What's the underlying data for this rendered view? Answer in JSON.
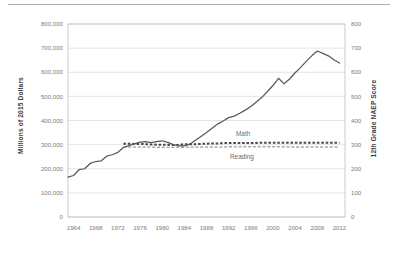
{
  "figure": {
    "name": "education-spending-vs-naep-scores-chart",
    "top_rule": true
  },
  "axes": {
    "left_title": "Millions of 2015 Dollars",
    "right_title": "12th Grade NAEP Score",
    "left_ticks": [
      "0",
      "100,000",
      "200,000",
      "300,000",
      "400,000",
      "500,000",
      "600,000",
      "700,000",
      "800,000"
    ],
    "right_ticks": [
      "0",
      "100",
      "200",
      "300",
      "400",
      "500",
      "600",
      "700",
      "800"
    ],
    "x_ticks": [
      "1964",
      "1968",
      "1972",
      "1976",
      "1980",
      "1984",
      "1988",
      "1992",
      "1996",
      "2000",
      "2004",
      "2008",
      "2012"
    ]
  },
  "labels": {
    "math": "Math",
    "reading": "Reading"
  },
  "colors": {
    "line": "#595959",
    "grid": "#d9d9d9",
    "frame": "#bfbfbf",
    "text": "#7a7a7a",
    "title": "#3f3f3f",
    "rule": "#b0b0b0"
  },
  "chart_data": {
    "type": "line",
    "title": "",
    "xlabel": "",
    "ylabel": "Millions of 2015 Dollars",
    "y2label": "12th Grade NAEP Score",
    "xlim": [
      1963,
      2013
    ],
    "ylim": [
      0,
      800000
    ],
    "y2lim": [
      0,
      800
    ],
    "grid": true,
    "legend": "inline-annotations",
    "x": [
      1963,
      1964,
      1965,
      1966,
      1967,
      1968,
      1969,
      1970,
      1971,
      1972,
      1973,
      1974,
      1975,
      1976,
      1977,
      1978,
      1979,
      1980,
      1981,
      1982,
      1983,
      1984,
      1985,
      1986,
      1987,
      1988,
      1989,
      1990,
      1991,
      1992,
      1993,
      1994,
      1995,
      1996,
      1997,
      1998,
      1999,
      2000,
      2001,
      2002,
      2003,
      2004,
      2005,
      2006,
      2007,
      2008,
      2009,
      2010,
      2011,
      2012
    ],
    "series": [
      {
        "name": "Total Spending",
        "axis": "left",
        "style": "solid",
        "units": "Millions of 2015 Dollars",
        "values": [
          165000,
          172000,
          196000,
          200000,
          222000,
          230000,
          233000,
          252000,
          258000,
          268000,
          288000,
          296000,
          303000,
          310000,
          312000,
          308000,
          312000,
          316000,
          309000,
          300000,
          295000,
          295000,
          302000,
          318000,
          334000,
          350000,
          368000,
          385000,
          398000,
          412000,
          418000,
          430000,
          443000,
          458000,
          477000,
          496000,
          520000,
          545000,
          575000,
          552000,
          572000,
          598000,
          620000,
          645000,
          668000,
          688000,
          678000,
          668000,
          652000,
          638000
        ]
      },
      {
        "name": "Math",
        "axis": "right",
        "style": "dotted-bold",
        "units": "12th Grade NAEP Score",
        "x": [
          1973,
          1974,
          1975,
          1976,
          1977,
          1978,
          1979,
          1980,
          1981,
          1982,
          1983,
          1984,
          1985,
          1986,
          1987,
          1988,
          1989,
          1990,
          1991,
          1992,
          1993,
          1994,
          1995,
          1996,
          1997,
          1998,
          1999,
          2000,
          2001,
          2002,
          2003,
          2004,
          2005,
          2006,
          2007,
          2008,
          2009,
          2010,
          2011,
          2012
        ],
        "values": [
          304,
          304,
          303,
          303,
          302,
          301,
          300,
          300,
          299,
          298,
          298,
          302,
          302,
          302,
          303,
          304,
          305,
          305,
          306,
          307,
          307,
          307,
          307,
          307,
          307,
          308,
          308,
          308,
          308,
          308,
          308,
          308,
          308,
          308,
          308,
          308,
          308,
          308,
          308,
          308
        ]
      },
      {
        "name": "Reading",
        "axis": "right",
        "style": "dashed-thin",
        "units": "12th Grade NAEP Score",
        "x": [
          1973,
          1974,
          1975,
          1976,
          1977,
          1978,
          1979,
          1980,
          1981,
          1982,
          1983,
          1984,
          1985,
          1986,
          1987,
          1988,
          1989,
          1990,
          1991,
          1992,
          1993,
          1994,
          1995,
          1996,
          1997,
          1998,
          1999,
          2000,
          2001,
          2002,
          2003,
          2004,
          2005,
          2006,
          2007,
          2008,
          2009,
          2010,
          2011,
          2012
        ],
        "values": [
          290,
          290,
          290,
          290,
          290,
          290,
          289,
          289,
          289,
          289,
          289,
          289,
          290,
          290,
          290,
          290,
          290,
          290,
          290,
          291,
          291,
          291,
          291,
          291,
          291,
          291,
          291,
          291,
          291,
          291,
          290,
          290,
          290,
          290,
          290,
          290,
          290,
          290,
          290,
          290
        ]
      }
    ]
  }
}
